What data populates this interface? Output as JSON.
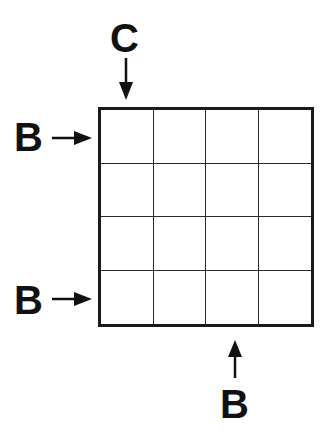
{
  "puzzle": {
    "grid": {
      "rows": 4,
      "cols": 4
    },
    "clues": [
      {
        "id": "top",
        "label": "C",
        "side": "top",
        "index": 0
      },
      {
        "id": "left-1",
        "label": "B",
        "side": "left",
        "index": 0
      },
      {
        "id": "left-4",
        "label": "B",
        "side": "left",
        "index": 3
      },
      {
        "id": "bottom",
        "label": "B",
        "side": "bottom",
        "index": 2
      }
    ]
  }
}
